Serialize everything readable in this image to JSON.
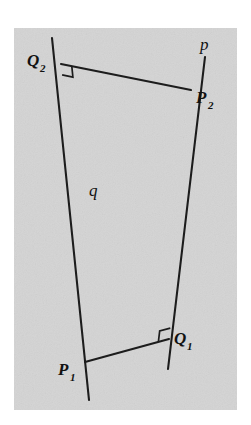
{
  "figure": {
    "background_color": "#d4d4d4",
    "ink_color": "#1c1c1c",
    "page_color": "#ffffff",
    "panel": {
      "x": 14,
      "y": 28,
      "width": 223,
      "height": 382
    },
    "labels": {
      "line_p": "p",
      "line_q": "q",
      "point_P1_base": "P",
      "point_P1_sub": "1",
      "point_P2_base": "P",
      "point_P2_sub": "2",
      "point_Q1_base": "Q",
      "point_Q1_sub": "1",
      "point_Q2_base": "Q",
      "point_Q2_sub": "2"
    },
    "geometry": {
      "line_p": {
        "x1": 205,
        "y1": 57,
        "x2": 168,
        "y2": 369
      },
      "line_q": {
        "x1": 52,
        "y1": 38,
        "x2": 89,
        "y2": 400
      },
      "segment_Q2_P2": {
        "x1": 61,
        "y1": 64,
        "x2": 191,
        "y2": 90
      },
      "segment_P1_Q1": {
        "x1": 85,
        "y1": 362,
        "x2": 169,
        "y2": 339
      },
      "crossing_point": {
        "x": 133,
        "y": 245
      },
      "right_angle_at_Q2": {
        "x": 61,
        "y": 64,
        "size": 11
      },
      "right_angle_at_Q1": {
        "x": 169,
        "y": 339,
        "size": 11
      }
    }
  },
  "chart_data": {
    "type": "diagram",
    "elements": [
      {
        "name": "p",
        "kind": "line",
        "role": "first line",
        "from": [
          205,
          57
        ],
        "to": [
          168,
          369
        ]
      },
      {
        "name": "q",
        "kind": "line",
        "role": "second line",
        "from": [
          52,
          38
        ],
        "to": [
          89,
          400
        ]
      },
      {
        "name": "P2",
        "kind": "point",
        "on_line": "p",
        "at": [
          191,
          90
        ]
      },
      {
        "name": "Q2",
        "kind": "point",
        "on_line": "q",
        "at": [
          61,
          64
        ],
        "role": "foot of perpendicular from P2 to q"
      },
      {
        "name": "P1",
        "kind": "point",
        "on_line": "q",
        "at": [
          85,
          362
        ]
      },
      {
        "name": "Q1",
        "kind": "point",
        "on_line": "p",
        "at": [
          169,
          339
        ],
        "role": "foot of perpendicular from P1 to p"
      },
      {
        "name": "Q2P2",
        "kind": "segment",
        "from": [
          61,
          64
        ],
        "to": [
          191,
          90
        ],
        "perpendicular_to": "q"
      },
      {
        "name": "P1Q1",
        "kind": "segment",
        "from": [
          85,
          362
        ],
        "to": [
          169,
          339
        ],
        "perpendicular_to": "p"
      }
    ],
    "right_angles": [
      "Q2",
      "Q1"
    ]
  }
}
